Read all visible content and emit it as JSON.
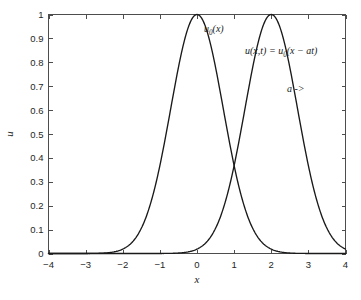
{
  "chart_data": {
    "type": "line",
    "title": "",
    "subtitle": "",
    "xlabel": "x",
    "ylabel": "u",
    "xlim": [
      -4,
      4
    ],
    "ylim": [
      0,
      1
    ],
    "grid": false,
    "legend_position": "none",
    "x_ticks": [
      "-4",
      "-3",
      "-2",
      "-1",
      "0",
      "1",
      "2",
      "3",
      "4"
    ],
    "x_tick_values": [
      -4,
      -3,
      -2,
      -1,
      0,
      1,
      2,
      3,
      4
    ],
    "y_ticks": [
      "0",
      "0.1",
      "0.2",
      "0.3",
      "0.4",
      "0.5",
      "0.6",
      "0.7",
      "0.8",
      "0.9",
      "1"
    ],
    "y_tick_values": [
      0,
      0.1,
      0.2,
      0.3,
      0.4,
      0.5,
      0.6,
      0.7,
      0.8,
      0.9,
      1
    ],
    "series": [
      {
        "name": "u0(x)",
        "formula": "exp(-x^2)",
        "peak_x": 0,
        "peak_y": 1,
        "color": "#1a1a1a",
        "x": [
          -4,
          -3.8,
          -3.6,
          -3.4,
          -3.2,
          -3,
          -2.8,
          -2.6,
          -2.4,
          -2.2,
          -2,
          -1.8,
          -1.6,
          -1.4,
          -1.2,
          -1,
          -0.8,
          -0.6,
          -0.4,
          -0.2,
          0,
          0.2,
          0.4,
          0.6,
          0.8,
          1,
          1.2,
          1.4,
          1.6,
          1.8,
          2,
          2.2,
          2.4,
          2.6,
          2.8,
          3,
          3.2,
          3.4,
          3.6,
          3.8,
          4
        ],
        "values": [
          0,
          0,
          0,
          1e-06,
          4e-05,
          0.0001,
          0.0004,
          0.0012,
          0.0032,
          0.008,
          0.0183,
          0.039,
          0.0773,
          0.1409,
          0.2369,
          0.3679,
          0.5273,
          0.6977,
          0.8521,
          0.9608,
          1,
          0.9608,
          0.8521,
          0.6977,
          0.5273,
          0.3679,
          0.2369,
          0.1409,
          0.0773,
          0.039,
          0.0183,
          0.008,
          0.0032,
          0.0012,
          0.0004,
          0.0001,
          4e-05,
          1e-06,
          0,
          0,
          0
        ]
      },
      {
        "name": "u(x,t)",
        "formula": "exp(-(x-2)^2)",
        "peak_x": 2,
        "peak_y": 1,
        "color": "#1a1a1a",
        "x": [
          -4,
          -3.8,
          -3.6,
          -3.4,
          -3.2,
          -3,
          -2.8,
          -2.6,
          -2.4,
          -2.2,
          -2,
          -1.8,
          -1.6,
          -1.4,
          -1.2,
          -1,
          -0.8,
          -0.6,
          -0.4,
          -0.2,
          0,
          0.2,
          0.4,
          0.6,
          0.8,
          1,
          1.2,
          1.4,
          1.6,
          1.8,
          2,
          2.2,
          2.4,
          2.6,
          2.8,
          3,
          3.2,
          3.4,
          3.6,
          3.8,
          4
        ],
        "values": [
          0,
          0,
          0,
          0,
          0,
          0,
          0,
          0,
          0,
          0,
          0,
          0,
          1e-06,
          4e-05,
          0.0001,
          0.0004,
          0.0012,
          0.0032,
          0.008,
          0.0183,
          0.0183,
          0.039,
          0.0773,
          0.1409,
          0.2369,
          0.3679,
          0.5273,
          0.6977,
          0.8521,
          0.9608,
          1,
          0.9608,
          0.8521,
          0.6977,
          0.5273,
          0.3679,
          0.2369,
          0.1409,
          0.0773,
          0.039,
          0.0183
        ]
      }
    ],
    "annotations": [
      {
        "id": "initial-profile-label",
        "text": "u0(x)",
        "text_main": "u",
        "text_sub": "0",
        "text_tail": "(x)",
        "x": 0.45,
        "y": 0.95
      },
      {
        "id": "translated-profile-label",
        "text": "u(x,t) = u0(x - at)",
        "part1": "u(x,t) = u",
        "part_sub": "0",
        "part2": "(x − at)",
        "x": 1.35,
        "y": 0.845
      },
      {
        "id": "advection-speed-label",
        "text": "a ->",
        "x": 2.5,
        "y": 0.685
      }
    ],
    "crossing_point": {
      "x": 1,
      "y": 0.368
    },
    "background_color": "#ffffff",
    "axis_color": "#4d4d4d",
    "curve_color": "#1a1a1a"
  }
}
